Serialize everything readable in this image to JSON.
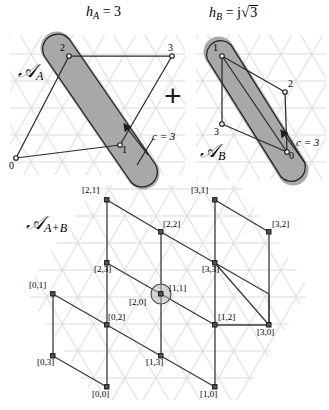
{
  "figure": {
    "title_left": "h_A = 3",
    "title_right": "h_B = j√3",
    "operator": "+",
    "background_lattice": "triangular-lattice",
    "lattice_color": "#d8d8d8",
    "line_color": "#2b2b2b",
    "shade_color": "#a8a8a8",
    "shade_stroke": "#1e1e1e"
  },
  "panel_a": {
    "set_label": "𝒜",
    "set_label_sub": "A",
    "h_symbol": "h",
    "h_sub": "A",
    "h_equals": "= 3",
    "c_label": "c = 3",
    "nodes": [
      {
        "name": "0",
        "x": 16,
        "y": 158
      },
      {
        "name": "1",
        "x": 120,
        "y": 145
      },
      {
        "name": "2",
        "x": 69,
        "y": 56
      },
      {
        "name": "3",
        "x": 172,
        "y": 56
      }
    ],
    "node_labels": [
      "0",
      "1",
      "2",
      "3"
    ]
  },
  "panel_b": {
    "set_label": "𝒜",
    "set_label_sub": "B",
    "h_symbol": "h",
    "h_sub": "B",
    "h_equals": "= j",
    "h_radical": "3",
    "c_label": "c = 3",
    "nodes": [
      {
        "name": "0",
        "x": 287,
        "y": 152
      },
      {
        "name": "1",
        "x": 222,
        "y": 56
      },
      {
        "name": "2",
        "x": 285,
        "y": 92
      },
      {
        "name": "3",
        "x": 222,
        "y": 124
      }
    ],
    "node_labels": [
      "0",
      "1",
      "2",
      "3"
    ]
  },
  "panel_sum": {
    "set_label": "𝒜",
    "set_label_sub": "A+B",
    "highlight_node": "[1,1]",
    "node_labels": [
      "[2,1]",
      "[3,1]",
      "[2,2]",
      "[3,2]",
      "[2,3]",
      "[3,3]",
      "[0,1]",
      "[1,1]",
      "[2,0]",
      "[0,2]",
      "[1,2]",
      "[3,0]",
      "[0,3]",
      "[1,3]",
      "[0,0]",
      "[1,0]"
    ],
    "nodes": [
      {
        "label": "[2,1]",
        "x": 107,
        "y": 200,
        "lx": 82,
        "ly": 186,
        "anchor": "left"
      },
      {
        "label": "[3,1]",
        "x": 215,
        "y": 200,
        "lx": 192,
        "ly": 186,
        "anchor": "left"
      },
      {
        "label": "[2,2]",
        "x": 161,
        "y": 232,
        "lx": 163,
        "ly": 222,
        "anchor": "left"
      },
      {
        "label": "[3,2]",
        "x": 269,
        "y": 232,
        "lx": 272,
        "ly": 222,
        "anchor": "left"
      },
      {
        "label": "[2,3]",
        "x": 107,
        "y": 263,
        "lx": 95,
        "ly": 266,
        "anchor": "left"
      },
      {
        "label": "[3,3]",
        "x": 215,
        "y": 263,
        "lx": 203,
        "ly": 266,
        "anchor": "left"
      },
      {
        "label": "[0,1]",
        "x": 53,
        "y": 294,
        "lx": 30,
        "ly": 281,
        "anchor": "left"
      },
      {
        "label": "[1,1]",
        "x": 161,
        "y": 294,
        "lx": 168,
        "ly": 283,
        "anchor": "left"
      },
      {
        "label": "[2,0]",
        "x": 161,
        "y": 294,
        "lx": 131,
        "ly": 299,
        "anchor": "left"
      },
      {
        "label": "[0,2]",
        "x": 107,
        "y": 325,
        "lx": 108,
        "ly": 315,
        "anchor": "left"
      },
      {
        "label": "[1,2]",
        "x": 215,
        "y": 325,
        "lx": 218,
        "ly": 315,
        "anchor": "left"
      },
      {
        "label": "[3,0]",
        "x": 269,
        "y": 325,
        "lx": 258,
        "ly": 328,
        "anchor": "left"
      },
      {
        "label": "[0,3]",
        "x": 53,
        "y": 356,
        "lx": 38,
        "ly": 359,
        "anchor": "left"
      },
      {
        "label": "[1,3]",
        "x": 161,
        "y": 356,
        "lx": 147,
        "ly": 359,
        "anchor": "left"
      },
      {
        "label": "[0,0]",
        "x": 107,
        "y": 387,
        "lx": 93,
        "ly": 390,
        "anchor": "left"
      },
      {
        "label": "[1,0]",
        "x": 215,
        "y": 387,
        "lx": 201,
        "ly": 390,
        "anchor": "left"
      }
    ]
  }
}
